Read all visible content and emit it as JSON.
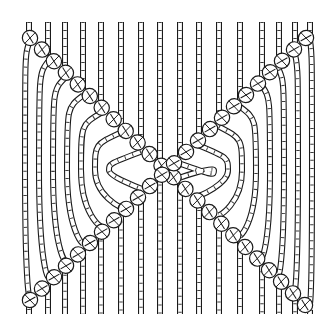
{
  "illustration": {
    "subject": "macrame diagonal double half hitch X pattern",
    "background": "#ffffff",
    "ink": "#1a1a1a",
    "width": 336,
    "height": 330,
    "top_y": 22,
    "bottom_y": 314,
    "cord_width": 6,
    "knot_rx": 10,
    "knot_ry": 7.5,
    "left_cords_x": [
      29,
      48,
      65,
      83,
      101,
      121,
      141,
      160
    ],
    "right_cords_x": [
      180,
      199,
      219,
      240,
      262,
      279,
      295,
      310
    ],
    "chain_a": {
      "name": "top-left to bottom-right",
      "from": [
        30,
        38
      ],
      "to": [
        305,
        305
      ],
      "knots": 24
    },
    "chain_b": {
      "name": "top-right to bottom-left",
      "from": [
        306,
        38
      ],
      "to": [
        30,
        300
      ],
      "knots": 24
    }
  }
}
